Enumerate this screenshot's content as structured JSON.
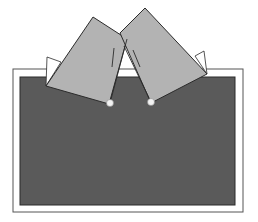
{
  "diagram": {
    "colors": {
      "background": "#ffffff",
      "frame_stroke": "#555555",
      "board_fill": "#5a5a5a",
      "card_fill": "#b3b3b3",
      "card_stroke": "#2b2b2b",
      "flap_fill": "#ffffff",
      "pin_fill": "#f2f2f2"
    },
    "frame": {
      "x": 13,
      "y": 69,
      "width": 230,
      "height": 143
    },
    "board": {
      "x": 20,
      "y": 77,
      "width": 215,
      "height": 128
    },
    "cards": [
      {
        "name": "left-card",
        "points": "93,17 127,39 109,104 46,86"
      },
      {
        "name": "right-card",
        "points": "145,8 207,74 151,103 120,33"
      }
    ],
    "flaps": [
      {
        "name": "left-flap",
        "points": "47,57 61,62 46,86"
      },
      {
        "name": "right-flap",
        "points": "195,56 204,51 207,74"
      }
    ],
    "pins": [
      {
        "name": "left-pin",
        "cx": 110,
        "cy": 103,
        "r": 3.5
      },
      {
        "name": "right-pin",
        "cx": 151,
        "cy": 102,
        "r": 3.5
      }
    ],
    "fold_lines": [
      {
        "name": "left-card-inner-edge",
        "x1": 127,
        "y1": 39,
        "x2": 110,
        "y2": 103
      },
      {
        "name": "right-card-inner-edge",
        "x1": 124,
        "y1": 46,
        "x2": 151,
        "y2": 102
      },
      {
        "name": "left-card-tick",
        "x1": 114,
        "y1": 48,
        "x2": 112,
        "y2": 67
      },
      {
        "name": "right-card-tick",
        "x1": 133,
        "y1": 50,
        "x2": 140,
        "y2": 67
      }
    ]
  }
}
